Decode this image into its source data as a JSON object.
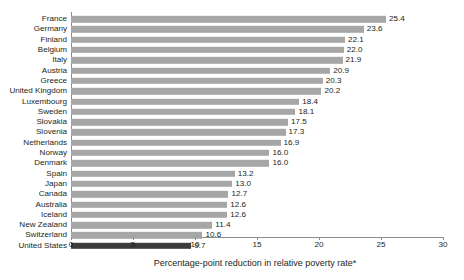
{
  "chart_data": {
    "type": "bar",
    "orientation": "horizontal",
    "title": "",
    "subtitle": "",
    "xlabel": "Percentage-point reduction in relative poverty rate*",
    "ylabel": "",
    "xlim": [
      0,
      30
    ],
    "xticks": [
      0,
      5,
      10,
      15,
      20,
      25,
      30
    ],
    "xtick_labels": [
      "0",
      "5",
      "10",
      "15",
      "20",
      "25",
      "30"
    ],
    "grid": false,
    "legend": null,
    "categories": [
      "France",
      "Germany",
      "Finland",
      "Belgium",
      "Italy",
      "Austria",
      "Greece",
      "United Kingdom",
      "Luxembourg",
      "Sweden",
      "Slovakia",
      "Slovenia",
      "Netherlands",
      "Norway",
      "Denmark",
      "Spain",
      "Japan",
      "Canada",
      "Australia",
      "Iceland",
      "New Zealand",
      "Switzerland",
      "United States"
    ],
    "values": [
      25.4,
      23.6,
      22.1,
      22.0,
      21.9,
      20.9,
      20.3,
      20.2,
      18.4,
      18.1,
      17.5,
      17.3,
      16.9,
      16.0,
      16.0,
      13.2,
      13.0,
      12.7,
      12.6,
      12.6,
      11.4,
      10.6,
      9.7
    ],
    "value_labels": [
      "25.4",
      "23.6",
      "22.1",
      "22.0",
      "21.9",
      "20.9",
      "20.3",
      "20.2",
      "18.4",
      "18.1",
      "17.5",
      "17.3",
      "16.9",
      "16.0",
      "16.0",
      "13.2",
      "13.0",
      "12.7",
      "12.6",
      "12.6",
      "11.4",
      "10.6",
      "9.7"
    ],
    "highlight_category": "United States",
    "colors": {
      "bar": "#a6a6a6",
      "bar_highlight": "#3b3b3b",
      "axis": "#8c8c8c",
      "text": "#231f20",
      "background": "#ffffff"
    }
  }
}
